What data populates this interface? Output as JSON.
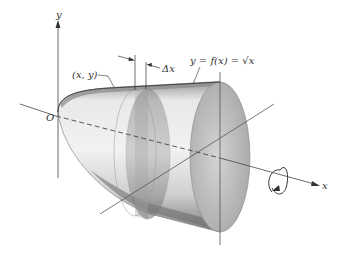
{
  "figure": {
    "type": "solid-of-revolution",
    "labels": {
      "y_axis": "y",
      "x_axis": "x",
      "origin": "O",
      "point": "(x, y)",
      "delta_x": "Δx",
      "curve": "y = f(x) = √x"
    },
    "colors": {
      "solid_light": "#e6e6e6",
      "solid_mid": "#bdbdbd",
      "solid_dark": "#7a7a7a",
      "disk": "#9a9a9a",
      "axis": "#444444"
    },
    "rotation_indicator": "counterclockwise-arrow"
  }
}
